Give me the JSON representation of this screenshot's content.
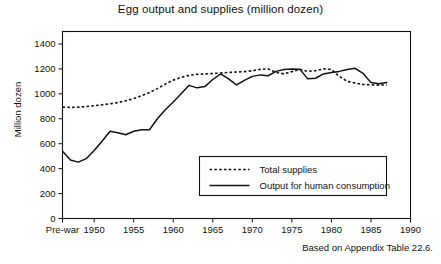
{
  "chart_data": {
    "type": "line",
    "title": "Egg output and supplies (million dozen)",
    "xlabel": "",
    "ylabel": "Million dozen",
    "caption": "Based on Appendix Table 22.6.",
    "xlim": [
      1946,
      1990
    ],
    "ylim": [
      0,
      1500
    ],
    "ytick_values": [
      0,
      200,
      400,
      600,
      800,
      1000,
      1200,
      1400
    ],
    "ytick_labels": [
      "0",
      "200",
      "400",
      "600",
      "800",
      "1000",
      "1200",
      "1400"
    ],
    "xtick_values": [
      1946,
      1950,
      1955,
      1960,
      1965,
      1970,
      1975,
      1980,
      1985,
      1990
    ],
    "xtick_labels": [
      "Pre-war",
      "1950",
      "1955",
      "1960",
      "1965",
      "1970",
      "1975",
      "1980",
      "1985",
      "1990"
    ],
    "grid": false,
    "legend_position": "lower-center-right",
    "series": [
      {
        "name": "Total supplies",
        "style": "dotted",
        "x": [
          1946,
          1947,
          1948,
          1949,
          1950,
          1951,
          1952,
          1953,
          1954,
          1955,
          1956,
          1957,
          1958,
          1959,
          1960,
          1961,
          1962,
          1963,
          1964,
          1965,
          1966,
          1967,
          1968,
          1969,
          1970,
          1971,
          1972,
          1973,
          1974,
          1975,
          1976,
          1977,
          1978,
          1979,
          1980,
          1981,
          1982,
          1983,
          1984,
          1985,
          1986,
          1987
        ],
        "values": [
          893,
          891,
          893,
          898,
          905,
          912,
          920,
          930,
          944,
          962,
          985,
          1010,
          1042,
          1078,
          1110,
          1132,
          1148,
          1157,
          1160,
          1163,
          1167,
          1172,
          1175,
          1178,
          1185,
          1196,
          1200,
          1172,
          1160,
          1178,
          1196,
          1180,
          1186,
          1200,
          1196,
          1140,
          1100,
          1086,
          1075,
          1072,
          1070,
          1072
        ]
      },
      {
        "name": "Output for human consumption",
        "style": "solid",
        "x": [
          1946,
          1947,
          1948,
          1949,
          1950,
          1951,
          1952,
          1953,
          1954,
          1955,
          1956,
          1957,
          1958,
          1959,
          1960,
          1961,
          1962,
          1963,
          1964,
          1965,
          1966,
          1967,
          1968,
          1969,
          1970,
          1971,
          1972,
          1973,
          1974,
          1975,
          1976,
          1977,
          1978,
          1979,
          1980,
          1981,
          1982,
          1983,
          1984,
          1985,
          1986,
          1987
        ],
        "values": [
          540,
          470,
          452,
          480,
          545,
          620,
          700,
          688,
          672,
          700,
          712,
          712,
          800,
          872,
          935,
          1000,
          1068,
          1048,
          1058,
          1115,
          1160,
          1120,
          1072,
          1108,
          1140,
          1152,
          1145,
          1180,
          1196,
          1200,
          1198,
          1120,
          1125,
          1160,
          1172,
          1180,
          1196,
          1205,
          1165,
          1090,
          1080,
          1090
        ]
      }
    ]
  },
  "legend": {
    "items": [
      {
        "label": "Total supplies",
        "style": "dotted"
      },
      {
        "label": "Output for human consumption",
        "style": "solid"
      }
    ]
  }
}
